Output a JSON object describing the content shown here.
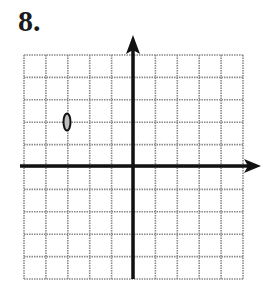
{
  "problem": {
    "number_label": "8."
  },
  "graph": {
    "grid": {
      "columns": 10,
      "rows": 10,
      "left": 24,
      "top": 55,
      "width": 219,
      "height": 224,
      "color": "#8a8a8a"
    },
    "axes": {
      "x_axis": {
        "y": 166,
        "x_start": 20,
        "x_end": 261,
        "arrow": "right"
      },
      "y_axis": {
        "x": 133,
        "y_start": 35,
        "y_end": 279,
        "arrow": "up"
      },
      "color": "#111111"
    },
    "points": [
      {
        "x": -3,
        "y": 2,
        "marker": "oval",
        "description": "plotted point"
      }
    ]
  }
}
